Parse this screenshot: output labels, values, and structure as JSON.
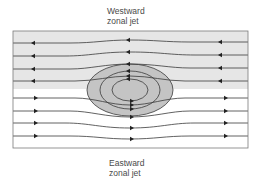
{
  "diagram": {
    "top_label": {
      "line1": "Westward",
      "line2": "zonal jet"
    },
    "bottom_label": {
      "line1": "Eastward",
      "line2": "zonal jet"
    },
    "colors": {
      "jet_shading": "#e6e6e6",
      "vortex_fill": "#c4c4c4",
      "lines": "#3a3a3a",
      "frame": "#7a7a7a"
    },
    "westward_streamlines": 4,
    "eastward_streamlines": 4,
    "vortex_rings": 3
  }
}
